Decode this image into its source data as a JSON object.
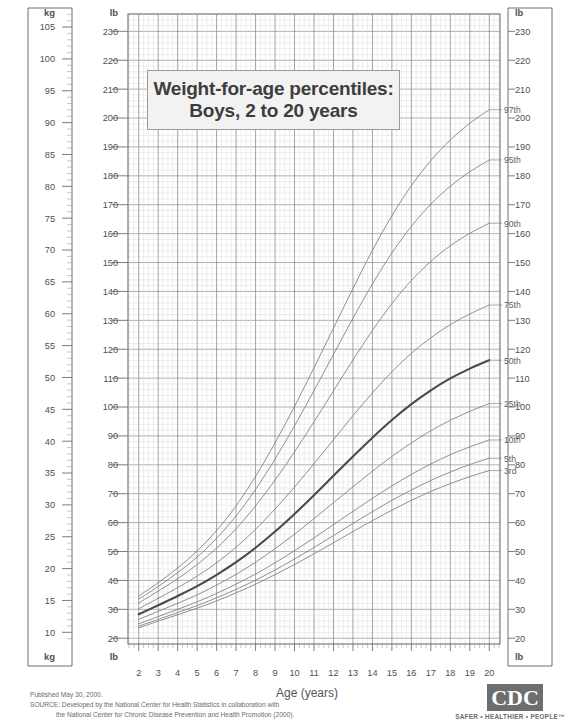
{
  "title": {
    "line1": "Weight-for-age percentiles:",
    "line2": "Boys, 2 to 20 years"
  },
  "axes": {
    "x_label": "Age (years)",
    "y_left_unit_top": "kg",
    "y_left_unit_bottom": "kg",
    "y_inner_unit_top": "lb",
    "y_inner_unit_bottom": "lb",
    "y_right_unit_top": "lb",
    "y_right_unit_bottom": "lb"
  },
  "footer": {
    "published": "Published May 30, 2000.",
    "source_line1": "SOURCE: Developed by the National Center for Health Statistics in collaboration with",
    "source_line2": "the National Center for Chronic Disease Prevention and Health Promotion (2000)."
  },
  "logo": {
    "mark": "CDC",
    "tagline": "SAFER • HEALTHIER • PEOPLE™"
  },
  "chart_data": {
    "type": "line",
    "title": "Weight-for-age percentiles: Boys, 2 to 20 years",
    "xlabel": "Age (years)",
    "ylabel": "Weight (lb / kg)",
    "xlim": [
      2,
      20
    ],
    "ylim_lb": [
      20,
      235
    ],
    "ylim_kg": [
      9,
      107
    ],
    "grid": true,
    "legend": "right-end-labels",
    "x_ticks": [
      2,
      3,
      4,
      5,
      6,
      7,
      8,
      9,
      10,
      11,
      12,
      13,
      14,
      15,
      16,
      17,
      18,
      19,
      20
    ],
    "y_ticks_lb": [
      20,
      30,
      40,
      50,
      60,
      70,
      80,
      90,
      100,
      110,
      120,
      130,
      140,
      150,
      160,
      170,
      180,
      190,
      200,
      210,
      220,
      230
    ],
    "y_ticks_kg": [
      10,
      15,
      20,
      25,
      30,
      35,
      40,
      45,
      50,
      55,
      60,
      65,
      70,
      75,
      80,
      85,
      90,
      95,
      100,
      105
    ],
    "x": [
      2,
      3,
      4,
      5,
      6,
      7,
      8,
      9,
      10,
      11,
      12,
      13,
      14,
      15,
      16,
      17,
      18,
      19,
      20
    ],
    "series": [
      {
        "name": "97th",
        "label": "97th",
        "emphasis": false,
        "values_lb": [
          34.6,
          39.2,
          44.3,
          50.2,
          57.3,
          65.8,
          76.0,
          87.6,
          100.2,
          113.6,
          127.3,
          141.0,
          154.2,
          166.2,
          176.6,
          185.3,
          192.4,
          198.2,
          202.9
        ]
      },
      {
        "name": "95th",
        "label": "95th",
        "emphasis": false,
        "values_lb": [
          33.5,
          37.9,
          42.7,
          48.1,
          54.6,
          62.3,
          71.5,
          82.0,
          93.5,
          105.7,
          118.2,
          130.7,
          142.6,
          153.3,
          162.5,
          170.2,
          176.4,
          181.4,
          185.5
        ]
      },
      {
        "name": "90th",
        "label": "90th",
        "emphasis": false,
        "values_lb": [
          32.2,
          36.3,
          40.6,
          45.5,
          51.2,
          57.9,
          65.8,
          74.7,
          84.5,
          94.9,
          105.6,
          116.3,
          126.5,
          135.8,
          143.8,
          150.4,
          155.8,
          160.1,
          163.6
        ]
      },
      {
        "name": "75th",
        "label": "75th",
        "emphasis": false,
        "values_lb": [
          30.2,
          33.8,
          37.5,
          41.5,
          46.1,
          51.5,
          57.7,
          64.7,
          72.3,
          80.4,
          88.7,
          97.0,
          104.9,
          112.2,
          118.6,
          124.0,
          128.5,
          132.2,
          135.3
        ]
      },
      {
        "name": "50th",
        "label": "50th",
        "emphasis": true,
        "values_lb": [
          28.3,
          31.4,
          34.6,
          38.0,
          41.9,
          46.3,
          51.3,
          56.9,
          63.0,
          69.5,
          76.2,
          82.9,
          89.4,
          95.5,
          101.0,
          105.8,
          109.9,
          113.3,
          116.2
        ]
      },
      {
        "name": "25th",
        "label": "25th",
        "emphasis": false,
        "values_lb": [
          26.5,
          29.3,
          32.1,
          35.0,
          38.4,
          42.1,
          46.3,
          51.0,
          56.0,
          61.4,
          66.9,
          72.4,
          77.8,
          82.9,
          87.6,
          91.8,
          95.4,
          98.5,
          101.2
        ]
      },
      {
        "name": "10th",
        "label": "10th",
        "emphasis": false,
        "values_lb": [
          25.0,
          27.5,
          30.0,
          32.6,
          35.5,
          38.7,
          42.2,
          46.1,
          50.3,
          54.7,
          59.3,
          63.9,
          68.4,
          72.7,
          76.7,
          80.3,
          83.5,
          86.2,
          88.6
        ]
      },
      {
        "name": "5th",
        "label": "5th",
        "emphasis": false,
        "values_lb": [
          24.2,
          26.5,
          28.9,
          31.3,
          34.0,
          36.9,
          40.1,
          43.6,
          47.4,
          51.4,
          55.5,
          59.7,
          63.8,
          67.7,
          71.3,
          74.6,
          77.5,
          80.1,
          82.3
        ]
      },
      {
        "name": "3rd",
        "label": "3rd",
        "emphasis": false,
        "values_lb": [
          23.6,
          25.9,
          28.1,
          30.4,
          32.9,
          35.7,
          38.7,
          42.0,
          45.5,
          49.2,
          53.0,
          56.9,
          60.7,
          64.3,
          67.7,
          70.8,
          73.5,
          75.9,
          78.0
        ]
      }
    ]
  }
}
